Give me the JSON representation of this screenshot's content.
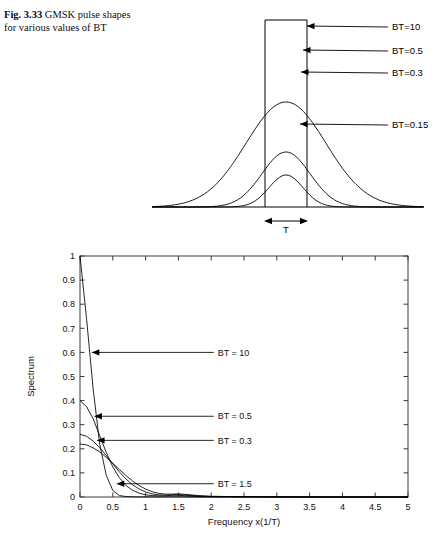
{
  "caption": {
    "lead": "Fig. 3.33",
    "text": "GMSK pulse shapes for various values of BT"
  },
  "top_figure": {
    "name": "gmsk-pulse-shapes",
    "duration_label": "T",
    "annotations": [
      {
        "label": "BT=10",
        "tip_x": 307,
        "tip_y": 26,
        "text_x": 392,
        "text_y": 30
      },
      {
        "label": "BT=0.5",
        "tip_x": 303,
        "tip_y": 50,
        "text_x": 392,
        "text_y": 54
      },
      {
        "label": "BT=0.3",
        "tip_x": 301,
        "tip_y": 72,
        "text_x": 392,
        "text_y": 76
      },
      {
        "label": "BT=0.15",
        "tip_x": 300,
        "tip_y": 124,
        "text_x": 392,
        "text_y": 128
      }
    ]
  },
  "chart_data": {
    "type": "line",
    "title": "",
    "xlabel": "Frequency x(1/T)",
    "ylabel": "Spectrum",
    "xlim": [
      0,
      5
    ],
    "ylim": [
      0,
      1
    ],
    "xticks": [
      0,
      0.5,
      1,
      1.5,
      2,
      2.5,
      3,
      3.5,
      4,
      4.5,
      5
    ],
    "xticklabels": [
      "0",
      "0.5",
      "1",
      "1.5",
      "2",
      "2.5",
      "3",
      "3.5",
      "4",
      "4.5",
      "5"
    ],
    "yticks": [
      0,
      0.1,
      0.2,
      0.3,
      0.4,
      0.5,
      0.6,
      0.7,
      0.8,
      0.9,
      1
    ],
    "yticklabels": [
      "0",
      "0.1",
      "0.2",
      "0.3",
      "0.4",
      "0.5",
      "0.6",
      "0.7",
      "0.8",
      "0.9",
      "1"
    ],
    "grid": false,
    "legend": "none",
    "x": [
      0,
      0.1,
      0.2,
      0.3,
      0.4,
      0.5,
      0.6,
      0.7,
      0.8,
      0.9,
      1.0,
      1.1,
      1.2,
      1.3,
      1.4,
      1.5,
      1.6,
      1.8,
      2.0,
      2.5,
      3.0,
      3.5,
      4.0,
      4.5,
      5.0
    ],
    "series": [
      {
        "name": "BT = 10",
        "values": [
          1.0,
          0.74,
          0.45,
          0.22,
          0.09,
          0.027,
          0.006,
          0.002,
          0.0008,
          0.0004,
          0.0003,
          0.0003,
          0.0004,
          0.0006,
          0.0008,
          0.0007,
          0.0004,
          0.0002,
          0.0001,
          0.0001,
          0.0,
          0.0,
          0.0,
          0.0,
          0.0
        ]
      },
      {
        "name": "BT = 0.5",
        "values": [
          0.4,
          0.375,
          0.325,
          0.255,
          0.185,
          0.125,
          0.08,
          0.048,
          0.028,
          0.016,
          0.009,
          0.006,
          0.005,
          0.005,
          0.007,
          0.007,
          0.005,
          0.002,
          0.001,
          0.001,
          0.0005,
          0.0002,
          0.0001,
          0.0,
          0.0
        ]
      },
      {
        "name": "BT = 0.3",
        "values": [
          0.26,
          0.252,
          0.232,
          0.205,
          0.172,
          0.138,
          0.104,
          0.075,
          0.051,
          0.033,
          0.021,
          0.013,
          0.009,
          0.008,
          0.009,
          0.01,
          0.008,
          0.004,
          0.002,
          0.001,
          0.0005,
          0.0002,
          0.0001,
          0.0,
          0.0
        ]
      },
      {
        "name": "BT = 1.5",
        "values": [
          0.22,
          0.216,
          0.204,
          0.187,
          0.165,
          0.14,
          0.114,
          0.089,
          0.067,
          0.048,
          0.033,
          0.022,
          0.015,
          0.012,
          0.012,
          0.013,
          0.011,
          0.006,
          0.003,
          0.001,
          0.0006,
          0.0003,
          0.0001,
          0.0,
          0.0
        ]
      }
    ],
    "annotations": [
      {
        "label": "BT = 10",
        "tip_x": 0.18,
        "tip_y": 0.6,
        "text_x": 2.1,
        "text_y": 0.6
      },
      {
        "label": "BT = 0.5",
        "tip_x": 0.22,
        "tip_y": 0.335,
        "text_x": 2.1,
        "text_y": 0.335
      },
      {
        "label": "BT = 0.3",
        "tip_x": 0.26,
        "tip_y": 0.235,
        "text_x": 2.1,
        "text_y": 0.235
      },
      {
        "label": "BT = 1.5",
        "tip_x": 0.56,
        "tip_y": 0.055,
        "text_x": 2.1,
        "text_y": 0.055
      }
    ]
  }
}
